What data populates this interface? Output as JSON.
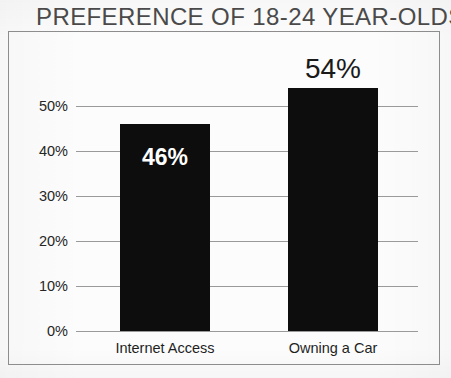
{
  "chart_data": {
    "type": "bar",
    "title": "PREFERENCE OF 18-24 YEAR-OLDS",
    "xlabel": "",
    "ylabel": "",
    "categories": [
      "Internet Access",
      "Owning a Car"
    ],
    "values": [
      46,
      54
    ],
    "value_labels": [
      "46%",
      "54%"
    ],
    "ylim": [
      0,
      50
    ],
    "yticks": [
      0,
      10,
      20,
      30,
      40,
      50
    ],
    "ytick_labels": [
      "0%",
      "10%",
      "20%",
      "30%",
      "40%",
      "50%"
    ],
    "grid": true,
    "legend": "none",
    "series": [
      {
        "name": "Preference",
        "values": [
          46,
          54
        ]
      }
    ],
    "colors": {
      "bar": "#0d0d0d",
      "gridline": "#9a9a9a",
      "frame": "#8d8d8d",
      "background": "#fcfcfc",
      "title_text": "#4a4a4a",
      "axis_text": "#262626",
      "inside_label_text": "#ffffff",
      "above_label_text": "#1a1a1a"
    }
  }
}
